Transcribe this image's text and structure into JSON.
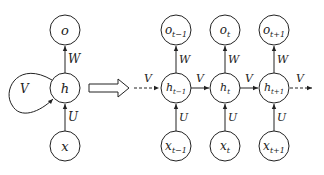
{
  "diagram": {
    "folded": {
      "nodes": {
        "output": "o",
        "hidden": "h",
        "input": "x"
      },
      "edges": {
        "input_to_hidden": "U",
        "hidden_to_output": "W",
        "recurrent": "V"
      }
    },
    "unfold_arrow": "unfold",
    "unfolded": {
      "steps": [
        {
          "o": "o",
          "o_sub": "t−1",
          "h": "h",
          "h_sub": "t−1",
          "x": "x",
          "x_sub": "t−1"
        },
        {
          "o": "o",
          "o_sub": "t",
          "h": "h",
          "h_sub": "t",
          "x": "x",
          "x_sub": "t"
        },
        {
          "o": "o",
          "o_sub": "t+1",
          "h": "h",
          "h_sub": "t+1",
          "x": "x",
          "x_sub": "t+1"
        }
      ],
      "edge_labels": {
        "U": "U",
        "W": "W",
        "V": "V"
      }
    }
  }
}
